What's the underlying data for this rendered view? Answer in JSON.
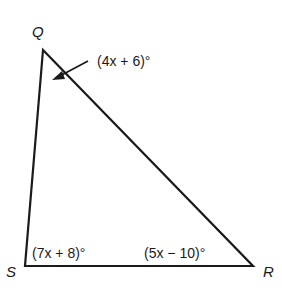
{
  "diagram": {
    "type": "triangle",
    "vertices": [
      {
        "name": "Q",
        "x": 43,
        "y": 50
      },
      {
        "name": "S",
        "x": 25,
        "y": 266
      },
      {
        "name": "R",
        "x": 253,
        "y": 266
      }
    ],
    "angles": {
      "Q": "(4x + 6)°",
      "S": "(7x + 8)°",
      "R": "(5x − 10)°"
    },
    "labels": {
      "Q": "Q",
      "S": "S",
      "R": "R"
    },
    "colors": {
      "line": "#1a1a1a",
      "background": "#ffffff"
    }
  }
}
